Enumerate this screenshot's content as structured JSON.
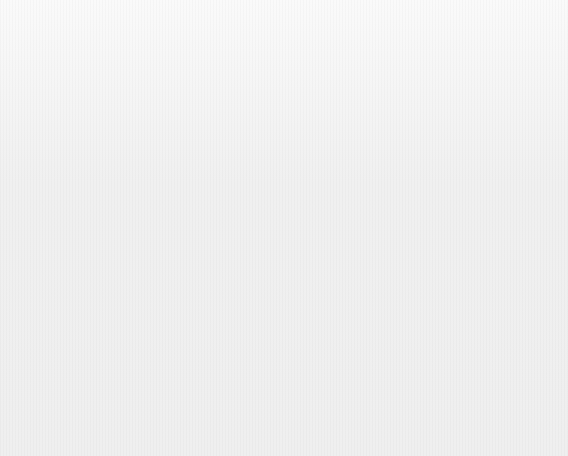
{
  "figure": {
    "background_color": "#f1f1f1",
    "bar_color": "#a9a9a9",
    "axis_color": "#555555"
  },
  "panel_a": {
    "title": "(a) Insurance losses ($bn)",
    "axis": {
      "ticks": [
        "0",
        "2",
        "4",
        "6",
        "8",
        "10"
      ],
      "min": 0,
      "max": 10
    }
  },
  "panel_b": {
    "title": "(b) Number of victims dead or missing",
    "axis": {
      "ticks": [
        "0",
        "500",
        "1,000",
        "1,500",
        "2,000",
        "2,500"
      ],
      "min": 0,
      "max": 2500
    }
  },
  "victims_column": {
    "header_line1": "No. of victims",
    "header_line2": "dead or missing"
  },
  "chart_data": [
    {
      "type": "bar",
      "orientation": "horizontal",
      "title": "(a) Insurance losses ($bn)",
      "xlabel": "Insurance losses ($bn)",
      "ylabel": "",
      "xlim": [
        0,
        10
      ],
      "xticks": [
        0,
        2,
        4,
        6,
        8,
        10
      ],
      "xticklabels": [
        "0",
        "2",
        "4",
        "6",
        "8",
        "10"
      ],
      "grid": false,
      "legend": "none",
      "categories": [
        "USA/Bahamas Hurricane Katrina",
        "USA/Cuba Hurricane Rita",
        "USA/Caribbean Hurricane Wilma",
        "Europe Winter storm Erwin",
        "Europe Rain, floods and landslides",
        "USA/Caribbean Hurricane Dennis",
        "India Floods and landslides",
        "USA Thunderstorms",
        "UK/Ireland Storm Gero",
        "Asia Typhoon Nabi"
      ],
      "values": [
        45,
        5.0,
        5.0,
        1.6,
        1.7,
        1.2,
        0.9,
        0.9,
        0.9,
        0.8
      ],
      "value_labels": [
        "45",
        "",
        "",
        "",
        "",
        "",
        "",
        "",
        "",
        ""
      ],
      "truncated_bars": [
        0
      ],
      "rows": [
        {
          "place": "USA/Bahamas",
          "event": "Hurricane Katrina",
          "loss": 45,
          "loss_label": "45",
          "truncated": true,
          "victims": "1,326"
        },
        {
          "place": "USA/Cuba",
          "event": "Hurricane Rita",
          "loss": 5.0,
          "loss_label": "",
          "truncated": false,
          "victims": "34"
        },
        {
          "place": "USA/Caribbean",
          "event": "Hurricane Wilma",
          "loss": 5.0,
          "loss_label": "",
          "truncated": false,
          "victims": "35"
        },
        {
          "place": "Europe",
          "event": "Winter storm Erwin",
          "loss": 1.6,
          "loss_label": "",
          "truncated": false,
          "victims": "18"
        },
        {
          "place": "Europe",
          "event": "Rain, floods and landslides",
          "loss": 1.7,
          "loss_label": "",
          "truncated": false,
          "victims": "49"
        },
        {
          "place": "USA/Caribbean",
          "event": "Hurricane Dennis",
          "loss": 1.2,
          "loss_label": "",
          "truncated": false,
          "victims": "65"
        },
        {
          "place": "India",
          "event": "Floods and landslides",
          "loss": 0.9,
          "loss_label": "",
          "truncated": false,
          "victims": "1,150"
        },
        {
          "place": "USA",
          "event": "Thunderstorms",
          "loss": 0.9,
          "loss_label": "",
          "truncated": false,
          "victims": "n.a."
        },
        {
          "place": "UK/Ireland",
          "event": "Storm Gero",
          "loss": 0.9,
          "loss_label": "",
          "truncated": false,
          "victims": "9"
        },
        {
          "place": "Asia",
          "event": "Typhoon Nabi",
          "loss": 0.8,
          "loss_label": "",
          "truncated": false,
          "victims": "34"
        }
      ]
    },
    {
      "type": "bar",
      "orientation": "horizontal",
      "title": "(b) Number of victims dead or missing",
      "xlabel": "Number of victims dead or missing",
      "ylabel": "",
      "xlim": [
        0,
        2500
      ],
      "xticks": [
        0,
        500,
        1000,
        1500,
        2000,
        2500
      ],
      "xticklabels": [
        "0",
        "500",
        "1,000",
        "1,500",
        "2,000",
        "2,500"
      ],
      "grid": false,
      "legend": "none",
      "categories": [
        "Pakistan/India Earthquake",
        "Pakistan Cold weather",
        "Latin America Hurricane Stan",
        "USA/Bahamas Hurricane Katrina",
        "Indonesia Earthquake",
        "India Floods and landslides",
        "Iraq Stampede",
        "Iran Earthquake",
        "India/Bangladesh/Nepal Heatwave",
        "India Stampede"
      ],
      "values": [
        73300,
        2000,
        1600,
        1350,
        1300,
        1150,
        1000,
        750,
        450,
        400
      ],
      "value_labels": [
        "73,300",
        "",
        "",
        "",
        "",
        "",
        "",
        "",
        "",
        ""
      ],
      "truncated_bars": [
        0
      ],
      "rows": [
        {
          "place": "Pakistan/India",
          "event": "Earthquake",
          "victims": 73300,
          "victims_label": "73,300",
          "truncated": true
        },
        {
          "place": "Pakistan",
          "event": "Cold weather",
          "victims": 2000,
          "victims_label": "",
          "truncated": false
        },
        {
          "place": "Latin America",
          "event": "Hurricane Stan",
          "victims": 1600,
          "victims_label": "",
          "truncated": false
        },
        {
          "place": "USA/Bahamas",
          "event": "Hurricane Katrina",
          "victims": 1350,
          "victims_label": "",
          "truncated": false
        },
        {
          "place": "Indonesia",
          "event": "Earthquake",
          "victims": 1300,
          "victims_label": "",
          "truncated": false
        },
        {
          "place": "India",
          "event": "Floods and landslides",
          "victims": 1150,
          "victims_label": "",
          "truncated": false
        },
        {
          "place": "Iraq",
          "event": "Stampede",
          "victims": 1000,
          "victims_label": "",
          "truncated": false
        },
        {
          "place": "Iran",
          "event": "Earthquake",
          "victims": 750,
          "victims_label": "",
          "truncated": false
        },
        {
          "place": "India/Bangladesh/Nepal",
          "event": "Heatwave",
          "victims": 450,
          "victims_label": "",
          "truncated": false
        },
        {
          "place": "India",
          "event": "Stampede",
          "victims": 400,
          "victims_label": "",
          "truncated": false
        }
      ]
    }
  ]
}
